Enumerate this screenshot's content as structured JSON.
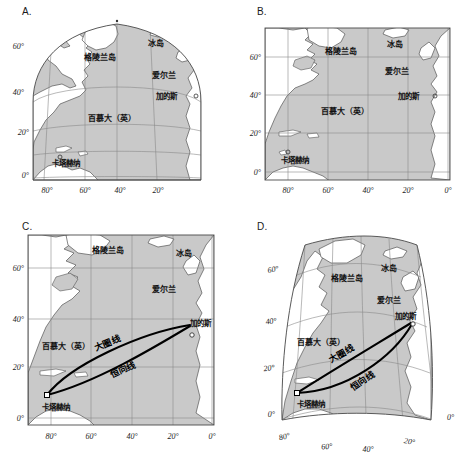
{
  "figure": {
    "width": 470,
    "height": 462,
    "background": "#ffffff"
  },
  "colors": {
    "ocean": "#c9c9c9",
    "land": "#ffffff",
    "coastline": "#555555",
    "graticule": "#8a8a8a",
    "frame": "#4a4a4a",
    "route": "#000000",
    "text": "#111111"
  },
  "panels": [
    {
      "id": "A",
      "label": "A.",
      "projection": "conic",
      "lat_ticks": [
        "60°",
        "40°",
        "20°",
        "0°"
      ],
      "lon_ticks": [
        "80°",
        "60°",
        "40°",
        "20°"
      ],
      "places": [
        {
          "name": "格陵兰岛"
        },
        {
          "name": "冰岛"
        },
        {
          "name": "爱尔兰"
        },
        {
          "name": "加的斯"
        },
        {
          "name": "百慕大（英）"
        },
        {
          "name": "卡塔赫纳"
        }
      ],
      "routes": []
    },
    {
      "id": "B",
      "label": "B.",
      "projection": "mercator",
      "lat_ticks": [
        "60°",
        "40°",
        "20°",
        "0°"
      ],
      "lon_ticks": [
        "80°",
        "60°",
        "40°",
        "20°",
        "0°"
      ],
      "places": [
        {
          "name": "格陵兰岛"
        },
        {
          "name": "冰岛"
        },
        {
          "name": "爱尔兰"
        },
        {
          "name": "加的斯"
        },
        {
          "name": "百慕大（英）"
        },
        {
          "name": "卡塔赫纳"
        }
      ],
      "routes": []
    },
    {
      "id": "C",
      "label": "C.",
      "projection": "mercator",
      "lat_ticks": [
        "60°",
        "40°",
        "20°",
        "0°"
      ],
      "lon_ticks": [
        "80°",
        "60°",
        "40°",
        "20°",
        "0°"
      ],
      "places": [
        {
          "name": "格陵兰岛"
        },
        {
          "name": "冰岛"
        },
        {
          "name": "爱尔兰"
        },
        {
          "name": "加的斯"
        },
        {
          "name": "百慕大（英）"
        },
        {
          "name": "卡塔赫纳"
        }
      ],
      "routes": [
        {
          "name": "大圈线",
          "kind": "great-circle"
        },
        {
          "name": "恒向线",
          "kind": "rhumb-line"
        }
      ]
    },
    {
      "id": "D",
      "label": "D.",
      "projection": "polyconic",
      "lat_ticks": [
        "60°",
        "40°",
        "20°",
        "0°"
      ],
      "lon_ticks": [
        "80°",
        "60°",
        "40°",
        "20°",
        "0°"
      ],
      "places": [
        {
          "name": "格陵兰岛"
        },
        {
          "name": "冰岛"
        },
        {
          "name": "爱尔兰"
        },
        {
          "name": "加的斯"
        },
        {
          "name": "百慕大（英）"
        },
        {
          "name": "卡塔赫纳"
        }
      ],
      "routes": [
        {
          "name": "大圈线",
          "kind": "great-circle"
        },
        {
          "name": "恒向线",
          "kind": "rhumb-line"
        }
      ]
    }
  ],
  "labels": {
    "greenland": "格陵兰岛",
    "iceland": "冰岛",
    "ireland": "爱尔兰",
    "cadiz": "加的斯",
    "bermuda": "百慕大（英）",
    "cartagena": "卡塔赫纳",
    "great_circle": "大圈线",
    "rhumb_line": "恒向线"
  },
  "ticks": {
    "lat60": "60°",
    "lat40": "40°",
    "lat20": "20°",
    "lat0": "0°",
    "lon80": "80°",
    "lon60": "60°",
    "lon40": "40°",
    "lon20": "20°",
    "lon0": "0°"
  }
}
